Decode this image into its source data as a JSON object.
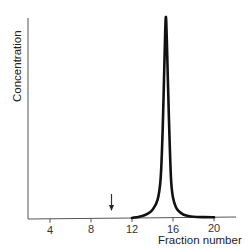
{
  "chart_data": {
    "type": "line",
    "title": "",
    "xlabel": "Fraction number",
    "ylabel": "Concentration",
    "x_ticks": [
      4,
      8,
      12,
      16,
      20
    ],
    "x_tick_labels": [
      "4",
      "8",
      "12",
      "16",
      "20"
    ],
    "xlim": [
      1.8,
      22
    ],
    "ylim": [
      0,
      1
    ],
    "grid": false,
    "legend": null,
    "y_ticks": [],
    "series": [
      {
        "name": "Concentration profile",
        "color": "#111111",
        "peak_fraction": 15.3,
        "x": [
          12,
          13,
          13.5,
          14,
          14.5,
          14.8,
          15.0,
          15.2,
          15.3,
          15.4,
          15.6,
          15.8,
          16.0,
          16.3,
          16.6,
          17.0,
          17.5,
          18,
          19,
          20
        ],
        "y": [
          0.0,
          0.01,
          0.02,
          0.04,
          0.09,
          0.2,
          0.45,
          0.85,
          1.0,
          0.88,
          0.5,
          0.2,
          0.1,
          0.05,
          0.03,
          0.015,
          0.007,
          0.003,
          0.001,
          0.0
        ]
      }
    ],
    "annotations": [
      {
        "type": "arrow",
        "direction": "down",
        "x": 10,
        "description": "Downward arrow marking fraction ~10 (void volume / marker position)"
      }
    ]
  }
}
